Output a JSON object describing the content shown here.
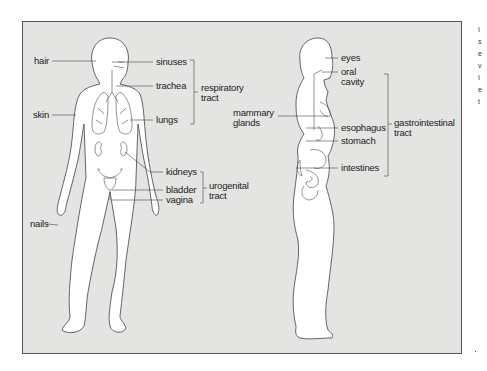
{
  "diagram": {
    "title": "",
    "front_figure": {
      "labels": {
        "hair": "hair",
        "skin": "skin",
        "nails": "nails",
        "sinuses": "sinuses",
        "trachea": "trachea",
        "lungs": "lungs",
        "kidneys": "kidneys",
        "bladder": "bladder",
        "vagina": "vagina"
      },
      "groups": {
        "respiratory_line1": "respiratory",
        "respiratory_line2": "tract",
        "urogenital_line1": "urogenital",
        "urogenital_line2": "tract"
      }
    },
    "side_figure": {
      "labels": {
        "eyes": "eyes",
        "oral_line1": "oral",
        "oral_line2": "cavity",
        "mammary_line1": "mammary",
        "mammary_line2": "glands",
        "esophagus": "esophagus",
        "stomach": "stomach",
        "intestines": "intestines"
      },
      "groups": {
        "gi_line1": "gastrointestinal",
        "gi_line2": "tract"
      }
    },
    "right_edge_fragments": [
      "I",
      "s",
      "e",
      "v",
      "I",
      "e",
      "t"
    ],
    "colors": {
      "panel_background": "#e4e4e2",
      "outline": "#555555",
      "body_fill": "#ffffff",
      "text": "#222222"
    }
  }
}
